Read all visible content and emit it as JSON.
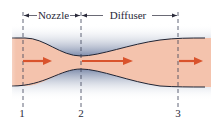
{
  "labels": {
    "nozzle": "Nozzle",
    "diffuser": "Diffuser"
  },
  "sections": [
    {
      "id": "1",
      "label": "1"
    },
    {
      "id": "2",
      "label": "2"
    },
    {
      "id": "3",
      "label": "3"
    }
  ],
  "colors": {
    "fluid": "#f4c3ad",
    "wall_shade": "#7e8cab",
    "wall_edge": "#1e2333",
    "arrow": "#d9532c",
    "dash": "#3a3f55"
  }
}
